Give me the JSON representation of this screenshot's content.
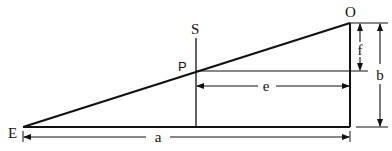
{
  "diagram": {
    "type": "geometry-similar-triangles",
    "colors": {
      "stroke": "#111111",
      "background": "#ffffff"
    },
    "points": {
      "E": {
        "label": "E"
      },
      "O": {
        "label": "O"
      },
      "S": {
        "label": "S"
      },
      "P": {
        "label": "P"
      }
    },
    "dimensions": {
      "a": {
        "label": "a",
        "description": "horizontal distance from E to the vertical through O"
      },
      "b": {
        "label": "b",
        "description": "vertical height from base to O"
      },
      "e": {
        "label": "e",
        "description": "horizontal distance from P (on line S) to the vertical through O"
      },
      "f": {
        "label": "f",
        "description": "vertical distance from O down to the level of P"
      }
    }
  }
}
